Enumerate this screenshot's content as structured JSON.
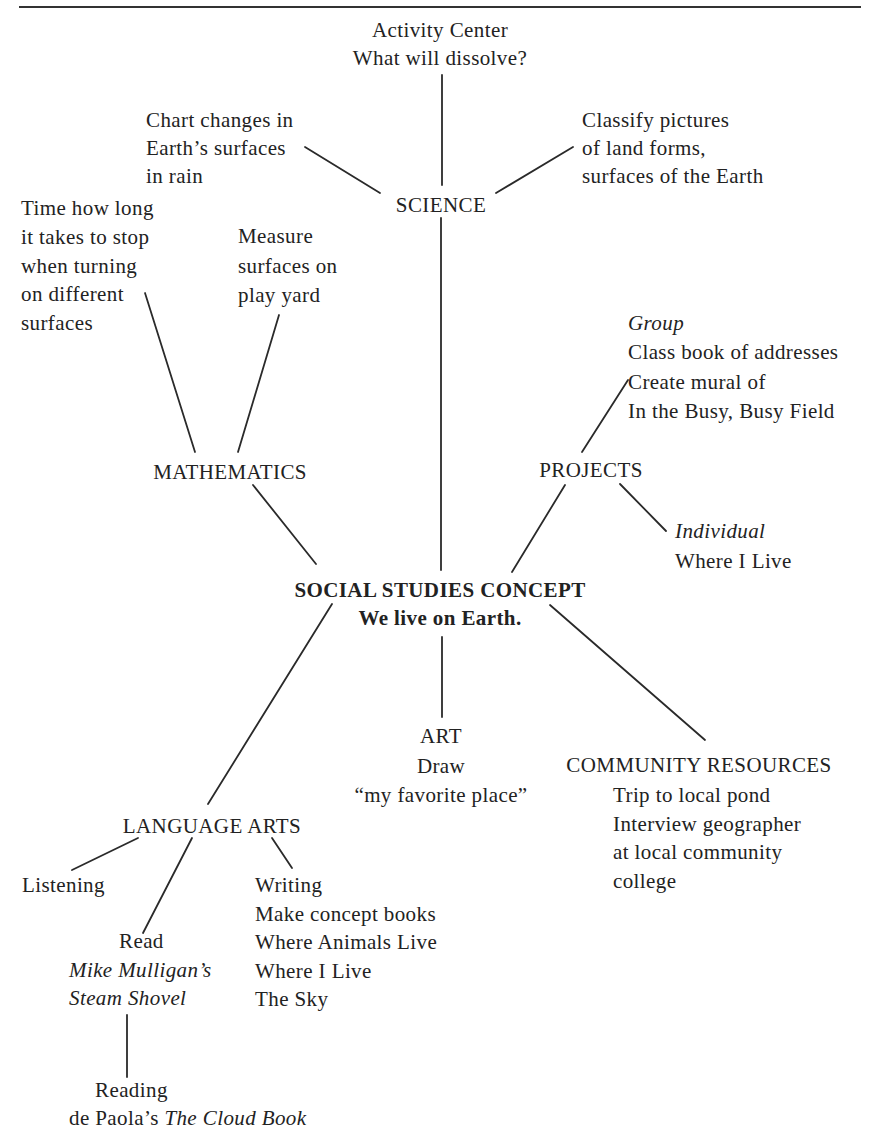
{
  "diagram": {
    "center": {
      "title": "SOCIAL STUDIES CONCEPT",
      "subtitle": "We live on Earth."
    },
    "science": {
      "label": "SCIENCE",
      "activity_center": [
        "Activity Center",
        "What will dissolve?"
      ],
      "chart_changes": [
        "Chart changes in",
        "Earth’s surfaces",
        "in rain"
      ],
      "classify": [
        "Classify pictures",
        "of land forms,",
        "surfaces of the Earth"
      ]
    },
    "mathematics": {
      "label": "MATHEMATICS",
      "time_activity": [
        "Time how long",
        "it takes to stop",
        "when turning",
        "on different",
        "surfaces"
      ],
      "measure_activity": [
        "Measure",
        "surfaces on",
        "play yard"
      ]
    },
    "projects": {
      "label": "PROJECTS",
      "group_heading": "Group",
      "group_items": [
        "Class book of addresses",
        "Create mural of",
        "In the Busy, Busy Field"
      ],
      "individual_heading": "Individual",
      "individual_items": [
        "Where I Live"
      ]
    },
    "art": {
      "label": "ART",
      "lines": [
        "Draw",
        "“my favorite place”"
      ]
    },
    "community_resources": {
      "label": "COMMUNITY RESOURCES",
      "items": [
        "Trip to local pond",
        "Interview geographer",
        "at local community",
        "college"
      ]
    },
    "language_arts": {
      "label": "LANGUAGE ARTS",
      "listening": "Listening",
      "read": {
        "label": "Read",
        "title_lines": [
          "Mike Mulligan’s",
          "Steam Shovel"
        ]
      },
      "writing": {
        "label": "Writing",
        "items": [
          "Make concept books",
          "Where Animals Live",
          "Where I Live",
          "The Sky"
        ]
      },
      "reading": {
        "label": "Reading",
        "author": "de Paola’s ",
        "title": "The Cloud Book"
      }
    },
    "connections": [
      [
        "SCIENCE",
        "Activity Center"
      ],
      [
        "SCIENCE",
        "Chart changes"
      ],
      [
        "SCIENCE",
        "Classify pictures"
      ],
      [
        "SCIENCE",
        "SOCIAL STUDIES CONCEPT"
      ],
      [
        "MATHEMATICS",
        "Time how long"
      ],
      [
        "MATHEMATICS",
        "Measure surfaces"
      ],
      [
        "MATHEMATICS",
        "SOCIAL STUDIES CONCEPT"
      ],
      [
        "PROJECTS",
        "Group"
      ],
      [
        "PROJECTS",
        "Individual"
      ],
      [
        "PROJECTS",
        "SOCIAL STUDIES CONCEPT"
      ],
      [
        "SOCIAL STUDIES CONCEPT",
        "LANGUAGE ARTS"
      ],
      [
        "SOCIAL STUDIES CONCEPT",
        "ART"
      ],
      [
        "SOCIAL STUDIES CONCEPT",
        "COMMUNITY RESOURCES"
      ],
      [
        "LANGUAGE ARTS",
        "Listening"
      ],
      [
        "LANGUAGE ARTS",
        "Read"
      ],
      [
        "LANGUAGE ARTS",
        "Writing"
      ],
      [
        "Read",
        "Reading"
      ]
    ]
  }
}
